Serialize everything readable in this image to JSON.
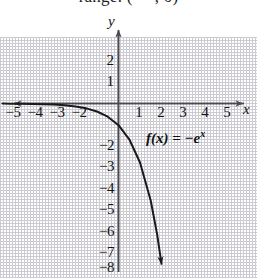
{
  "caption": {
    "text": "range: (−∞, 0)"
  },
  "axes": {
    "y_label": "y",
    "x_label": "x"
  },
  "function_label": {
    "prefix": "f(x)  =  −e",
    "exponent": "x",
    "full": "f(x) = −e^x"
  },
  "colors": {
    "grid": "#c9c9cf",
    "axis": "#4a4a52",
    "curve": "#1a1a1a",
    "text": "#111111",
    "background": "#ffffff"
  },
  "chart_data": {
    "type": "line",
    "title": "",
    "subtitle": "range: (−∞, 0)",
    "xlabel": "x",
    "ylabel": "y",
    "xlim": [
      -5.5,
      6.2
    ],
    "ylim": [
      -8.6,
      2.7
    ],
    "grid": true,
    "legend": "none",
    "annotations": [
      {
        "text": "f(x) = −e^x",
        "x": 2.0,
        "y": -1.9
      }
    ],
    "x_ticks": [
      -5,
      -4,
      -3,
      -2,
      1,
      2,
      3,
      4,
      5
    ],
    "x_tick_labels": [
      "−5",
      "−4",
      "−3",
      "−2",
      "1",
      "2",
      "3",
      "4",
      "5"
    ],
    "y_ticks": [
      2,
      1,
      -2,
      -3,
      -4,
      -5,
      -6,
      -7,
      -8
    ],
    "y_tick_labels": [
      "2",
      "1",
      "−2",
      "−3",
      "−4",
      "−5",
      "−6",
      "−7",
      "−8"
    ],
    "series": [
      {
        "name": "f(x) = −e^x",
        "equation": "y = -exp(x)",
        "style": "solid",
        "color": "#1a1a1a",
        "arrow_end": "down-right",
        "arrow_start": "left-asymptote",
        "x": [
          -5.4,
          -5.0,
          -4.5,
          -4.0,
          -3.5,
          -3.0,
          -2.5,
          -2.0,
          -1.5,
          -1.0,
          -0.5,
          0.0,
          0.5,
          1.0,
          1.5,
          1.8,
          2.0,
          2.15
        ],
        "y": [
          -0.0045,
          -0.0067,
          -0.0111,
          -0.0183,
          -0.0302,
          -0.0498,
          -0.0821,
          -0.1353,
          -0.2231,
          -0.3679,
          -0.6065,
          -1.0,
          -1.6487,
          -2.7183,
          -4.4817,
          -6.0496,
          -7.3891,
          -8.585
        ]
      }
    ]
  }
}
